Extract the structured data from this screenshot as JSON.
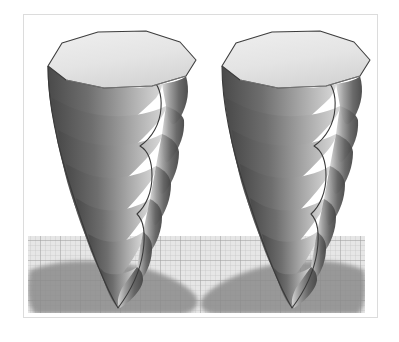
{
  "scene": {
    "title": "Twisted helical cone pair",
    "background_color": "#ffffff",
    "frame_color": "#dcdcdc",
    "frame": {
      "x": 23,
      "y": 14,
      "width": 355,
      "height": 304
    }
  },
  "floor": {
    "name": "grid-floor-plane",
    "x": 28,
    "y": 236,
    "width": 337,
    "height": 77,
    "fill_color": "#e3e3e3",
    "grid_line_color": "#b8b8b8",
    "grid_minor_spacing": 5,
    "grid_major_spacing": 20,
    "grid_major_color": "#a0a0a0"
  },
  "shadows": [
    {
      "name": "shadow-left",
      "color": "#8a8a8a",
      "cx": 112,
      "cy": 288,
      "rx": 78,
      "ry": 26
    },
    {
      "name": "shadow-right",
      "color": "#8a8a8a",
      "cx": 288,
      "cy": 288,
      "rx": 78,
      "ry": 26
    }
  ],
  "objects": [
    {
      "name": "twisted-cone-left",
      "apex_x": 118,
      "apex_y": 308,
      "top_center_x": 118,
      "top_center_y": 62,
      "top_radius_x": 78,
      "top_radius_y": 28,
      "blade_count": 7,
      "twist_turns": 1.05,
      "top_face_color": "#e6e6e6",
      "top_edge_color": "#4d4d4d",
      "surface_light_color": "#dcdcdc",
      "surface_dark_color": "#4a4a4a",
      "outline_color": "#3f3f3f"
    },
    {
      "name": "twisted-cone-right",
      "apex_x": 292,
      "apex_y": 308,
      "top_center_x": 292,
      "top_center_y": 62,
      "top_radius_x": 78,
      "top_radius_y": 28,
      "blade_count": 7,
      "twist_turns": 1.05,
      "top_face_color": "#e6e6e6",
      "top_edge_color": "#4d4d4d",
      "surface_light_color": "#dcdcdc",
      "surface_dark_color": "#4a4a4a",
      "outline_color": "#3f3f3f"
    }
  ],
  "palette": {
    "white": "#ffffff",
    "frame_gray": "#dcdcdc",
    "floor_gray": "#e3e3e3",
    "grid_gray": "#b8b8b8",
    "shadow_gray": "#8a8a8a",
    "highlight_gray": "#e6e6e6",
    "shade_dark": "#4a4a4a",
    "outline": "#3f3f3f"
  }
}
